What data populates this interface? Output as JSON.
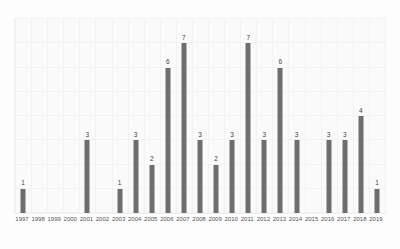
{
  "chart_data": {
    "type": "bar",
    "title": "",
    "xlabel": "",
    "ylabel": "",
    "grid": true,
    "legend": false,
    "ylim": [
      0,
      8
    ],
    "bar_color": "#6e6e6e",
    "background_color": "#fafafa",
    "grid_color": "#f2f2f2",
    "show_value_labels": true,
    "categories": [
      "1997",
      "1998",
      "1999",
      "2000",
      "2001",
      "2002",
      "2003",
      "2004",
      "2005",
      "2006",
      "2007",
      "2008",
      "2009",
      "2010",
      "2011",
      "2012",
      "2013",
      "2014",
      "2015",
      "2016",
      "2017",
      "2018",
      "2019"
    ],
    "values": [
      1,
      0,
      0,
      0,
      3,
      0,
      1,
      3,
      2,
      6,
      7,
      3,
      2,
      3,
      7,
      3,
      6,
      3,
      0,
      3,
      3,
      4,
      1
    ],
    "value_labels": [
      "1",
      "",
      "",
      "",
      "3",
      "",
      "1",
      "3",
      "2",
      "6",
      "7",
      "3",
      "2",
      "3",
      "7",
      "3",
      "6",
      "3",
      "",
      "3",
      "3",
      "4",
      "1"
    ],
    "ytick_values": [
      0,
      1,
      2,
      3,
      4,
      5,
      6,
      7,
      8
    ],
    "ytick_labels": [
      "",
      "",
      "",
      "",
      "",
      "",
      "",
      "",
      ""
    ]
  }
}
